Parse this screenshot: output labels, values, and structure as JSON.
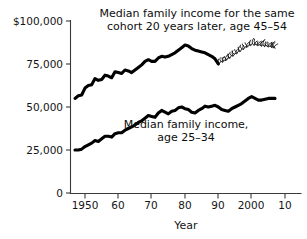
{
  "chart_data": {
    "type": "line",
    "title": "",
    "xlabel": "Year",
    "ylabel": "",
    "xlim": [
      1947,
      2008
    ],
    "ylim": [
      0,
      105000
    ],
    "grid": false,
    "legend_position": "inline-annotations",
    "x_tick_labels": [
      "1950",
      "60",
      "70",
      "80",
      "90",
      "2000",
      "10"
    ],
    "x_tick_values": [
      1950,
      1960,
      1970,
      1980,
      1990,
      2000,
      2010
    ],
    "y_tick_labels": [
      "$100,000",
      "75,000",
      "50,000",
      "25,000",
      "0"
    ],
    "y_tick_values": [
      100000,
      75000,
      50000,
      25000,
      0
    ],
    "annotations": [
      {
        "id": "upper-series-label",
        "line1": "Median family income for the same",
        "line2": "cohort 20 years later, age 45–54"
      },
      {
        "id": "lower-series-label",
        "line1": "Median family income,",
        "line2": "age 25–34"
      }
    ],
    "series": [
      {
        "name": "Median family income for the same cohort 20 years later, age 45-54",
        "style": "solid",
        "x": [
          1947,
          1948,
          1949,
          1950,
          1951,
          1952,
          1953,
          1954,
          1955,
          1956,
          1957,
          1958,
          1959,
          1960,
          1961,
          1962,
          1963,
          1964,
          1965,
          1966,
          1967,
          1968,
          1969,
          1970,
          1971,
          1972,
          1973,
          1974,
          1975,
          1976,
          1977,
          1978,
          1979,
          1980,
          1981,
          1982,
          1983,
          1984,
          1985,
          1986,
          1987,
          1988,
          1989,
          1990
        ],
        "values": [
          55000,
          56500,
          57000,
          61000,
          62500,
          63000,
          66500,
          65500,
          66000,
          68500,
          68000,
          67000,
          70500,
          70000,
          69500,
          71500,
          71000,
          70000,
          71500,
          73000,
          74500,
          76500,
          77500,
          76500,
          76500,
          78500,
          79500,
          79000,
          79500,
          80500,
          81500,
          83000,
          84500,
          86000,
          85500,
          84000,
          83000,
          82500,
          82000,
          81500,
          80500,
          79500,
          78000,
          75000
        ]
      },
      {
        "name": "Median family income, age 25-34",
        "style": "solid",
        "x": [
          1947,
          1948,
          1949,
          1950,
          1951,
          1952,
          1953,
          1954,
          1955,
          1956,
          1957,
          1958,
          1959,
          1960,
          1961,
          1962,
          1963,
          1964,
          1965,
          1966,
          1967,
          1968,
          1969,
          1970,
          1971,
          1972,
          1973,
          1974,
          1975,
          1976,
          1977,
          1978,
          1979,
          1980,
          1981,
          1982,
          1983,
          1984,
          1985,
          1986,
          1987,
          1988,
          1989,
          1990,
          1991,
          1992,
          1993,
          1994,
          1995,
          1996,
          1997,
          1998,
          1999,
          2000,
          2001,
          2002,
          2003,
          2004,
          2005,
          2006,
          2007
        ],
        "values": [
          25000,
          25000,
          25500,
          27000,
          28000,
          29000,
          30500,
          30000,
          31500,
          33000,
          33000,
          32500,
          34500,
          35000,
          35000,
          36500,
          37500,
          38500,
          39500,
          41000,
          42000,
          43500,
          45000,
          44500,
          44000,
          46500,
          48000,
          47000,
          46000,
          47500,
          48000,
          49500,
          50000,
          49000,
          48500,
          47000,
          46500,
          48000,
          49000,
          50500,
          50000,
          50500,
          51000,
          50000,
          48500,
          48000,
          47500,
          49000,
          50000,
          51000,
          52000,
          53500,
          55000,
          56000,
          55000,
          54000,
          54000,
          54500,
          55000,
          55000,
          55000
        ]
      },
      {
        "name": "Projection for cohort 20 years later (hand-drawn squiggle)",
        "style": "squiggle",
        "x": [
          1990,
          1992,
          1994,
          1996,
          1998,
          2000,
          2002,
          2004,
          2006,
          2007
        ],
        "values": [
          75500,
          77000,
          79500,
          82000,
          84500,
          86500,
          86000,
          85500,
          85000,
          84500
        ]
      }
    ]
  }
}
